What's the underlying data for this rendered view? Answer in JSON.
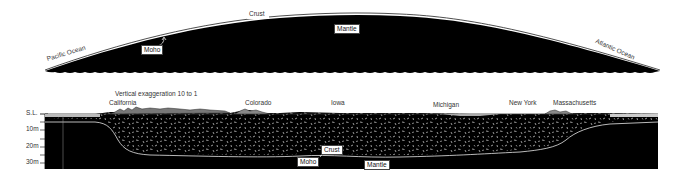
{
  "upper_profile": {
    "labels": {
      "crust": "Crust",
      "mantle": "Mantle",
      "moho": "Moho",
      "west_ocean": "Pacific  Ocean",
      "east_ocean": "Atlantic Ocean"
    }
  },
  "caption": "Vertical exaggeration  10 to 1",
  "lower_section": {
    "states": [
      {
        "name": "California"
      },
      {
        "name": "Colorado"
      },
      {
        "name": "Iowa"
      },
      {
        "name": "Michigan"
      },
      {
        "name": "New York"
      },
      {
        "name": "Massachusetts"
      }
    ],
    "depth_axis": [
      {
        "label": "S.L."
      },
      {
        "label": "10m"
      },
      {
        "label": "20m"
      },
      {
        "label": "30m"
      }
    ],
    "labels": {
      "crust": "Crust",
      "moho": "Moho",
      "mantle": "Mantle"
    }
  },
  "colors": {
    "mantle_fill": "#000000",
    "crust_line": "#ffffff",
    "background": "#ffffff"
  }
}
